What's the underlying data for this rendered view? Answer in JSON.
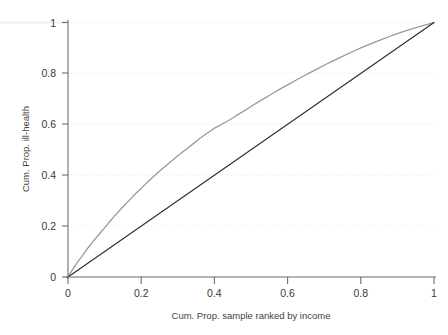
{
  "chart_data": {
    "type": "line",
    "title": "",
    "subtitle": "",
    "xlabel": "Cum. Prop. sample ranked by income",
    "ylabel": "Cum. Prop. ill-health",
    "xlim": [
      0,
      1
    ],
    "ylim": [
      0,
      1
    ],
    "xticks": [
      "0",
      "0.2",
      "0.4",
      "0.6",
      "0.8",
      "1"
    ],
    "yticks": [
      "0",
      "0.2",
      "0.4",
      "0.6",
      "0.8",
      "1"
    ],
    "xtick_values": [
      0,
      0.2,
      0.4,
      0.6,
      0.8,
      1
    ],
    "ytick_values": [
      0,
      0.2,
      0.4,
      0.6,
      0.8,
      1
    ],
    "grid": "dotted-light-both-axes",
    "legend": "none",
    "legend_position": "none",
    "series": [
      {
        "name": "Concentration curve (cumulative ill-health)",
        "color": "#9a9a9a",
        "linewidth": 1.3,
        "x": [
          0,
          0.005,
          0.012,
          0.02,
          0.028,
          0.036,
          0.045,
          0.055,
          0.065,
          0.075,
          0.085,
          0.095,
          0.105,
          0.115,
          0.125,
          0.135,
          0.145,
          0.155,
          0.165,
          0.175,
          0.185,
          0.195,
          0.21,
          0.225,
          0.24,
          0.255,
          0.27,
          0.285,
          0.3,
          0.315,
          0.33,
          0.345,
          0.36,
          0.375,
          0.39,
          0.4,
          0.41,
          0.42,
          0.435,
          0.45,
          0.465,
          0.48,
          0.5,
          0.52,
          0.54,
          0.56,
          0.58,
          0.6,
          0.62,
          0.64,
          0.66,
          0.68,
          0.7,
          0.72,
          0.74,
          0.76,
          0.78,
          0.8,
          0.82,
          0.84,
          0.86,
          0.88,
          0.9,
          0.92,
          0.94,
          0.96,
          0.98,
          1
        ],
        "y": [
          0,
          0.012,
          0.028,
          0.046,
          0.062,
          0.077,
          0.095,
          0.115,
          0.133,
          0.151,
          0.168,
          0.185,
          0.202,
          0.219,
          0.236,
          0.252,
          0.268,
          0.283,
          0.298,
          0.313,
          0.328,
          0.342,
          0.363,
          0.383,
          0.403,
          0.422,
          0.44,
          0.458,
          0.476,
          0.493,
          0.51,
          0.527,
          0.544,
          0.56,
          0.575,
          0.585,
          0.592,
          0.6,
          0.612,
          0.625,
          0.639,
          0.652,
          0.67,
          0.688,
          0.705,
          0.722,
          0.739,
          0.755,
          0.771,
          0.787,
          0.802,
          0.817,
          0.832,
          0.846,
          0.86,
          0.874,
          0.887,
          0.9,
          0.912,
          0.924,
          0.935,
          0.946,
          0.956,
          0.966,
          0.975,
          0.984,
          0.992,
          1
        ]
      },
      {
        "name": "Line of equality (45 degree diagonal)",
        "color": "#2b2b2b",
        "linewidth": 1.1,
        "x": [
          0,
          1
        ],
        "y": [
          0,
          1
        ]
      }
    ],
    "annotations": []
  },
  "colors": {
    "curve": "#9a9a9a",
    "equality_line": "#2b2b2b",
    "axis": "#6b6b6b",
    "grid": "#e4e4e4",
    "text": "#3a3a3a",
    "background": "#ffffff"
  }
}
